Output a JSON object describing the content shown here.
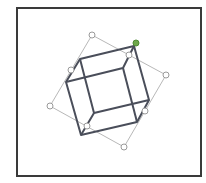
{
  "figure": {
    "colors": {
      "frame": "#3a3a3a",
      "cube_edges": "#4a4e5a",
      "selection_box": "#b8b8b8",
      "handle_fill": "#ffffff",
      "handle_stroke": "#9a9a9a",
      "rotation_handle": "#6fa84a"
    },
    "selection_box": {
      "corners": [
        [
          92,
          35
        ],
        [
          166,
          75
        ],
        [
          124,
          147
        ],
        [
          50,
          106
        ]
      ]
    },
    "handles": [
      {
        "name": "top-left",
        "x": 92,
        "y": 35
      },
      {
        "name": "top-mid",
        "x": 129,
        "y": 55
      },
      {
        "name": "right",
        "x": 166,
        "y": 75
      },
      {
        "name": "right-mid",
        "x": 145,
        "y": 111
      },
      {
        "name": "bottom",
        "x": 124,
        "y": 147
      },
      {
        "name": "bottom-mid",
        "x": 87,
        "y": 126
      },
      {
        "name": "left",
        "x": 50,
        "y": 106
      },
      {
        "name": "left-mid",
        "x": 71,
        "y": 70
      }
    ],
    "rotation_handle": {
      "x": 136,
      "y": 43
    },
    "cube": {
      "outer": [
        [
          80,
          60
        ],
        [
          134,
          47
        ],
        [
          149,
          102
        ],
        [
          137,
          122
        ],
        [
          81,
          135
        ],
        [
          66,
          82
        ]
      ],
      "inner_front": [
        [
          80,
          60
        ],
        [
          123,
          51
        ],
        [
          136,
          98
        ],
        [
          94,
          111
        ]
      ],
      "inner_back": [
        [
          66,
          82
        ],
        [
          80,
          77
        ],
        [
          126,
          67
        ],
        [
          134,
          47
        ]
      ]
    }
  }
}
